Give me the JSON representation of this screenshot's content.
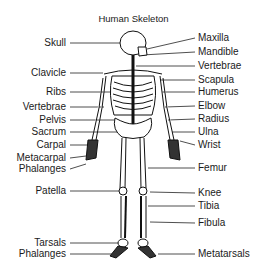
{
  "title": "Human Skeleton",
  "labels_left": [
    {
      "text": "Skull",
      "y": 42
    },
    {
      "text": "Clavicle",
      "y": 72
    },
    {
      "text": "Ribs",
      "y": 91
    },
    {
      "text": "Vertebrae",
      "y": 106
    },
    {
      "text": "Pelvis",
      "y": 119
    },
    {
      "text": "Sacrum",
      "y": 131
    },
    {
      "text": "Carpal",
      "y": 144
    },
    {
      "text": "Metacarpal",
      "y": 157
    },
    {
      "text": "Phalanges",
      "y": 168
    },
    {
      "text": "Patella",
      "y": 190
    },
    {
      "text": "Tarsals",
      "y": 242
    },
    {
      "text": "Phalanges",
      "y": 253
    }
  ],
  "labels_right": [
    {
      "text": "Maxilla",
      "y": 37
    },
    {
      "text": "Mandible",
      "y": 51
    },
    {
      "text": "Vertebrae",
      "y": 65
    },
    {
      "text": "Scapula",
      "y": 79
    },
    {
      "text": "Humerus",
      "y": 91
    },
    {
      "text": "Elbow",
      "y": 105
    },
    {
      "text": "Radius",
      "y": 118
    },
    {
      "text": "Ulna",
      "y": 131
    },
    {
      "text": "Wrist",
      "y": 144
    },
    {
      "text": "Femur",
      "y": 167
    },
    {
      "text": "Knee",
      "y": 192
    },
    {
      "text": "Tibia",
      "y": 205
    },
    {
      "text": "Fibula",
      "y": 222
    },
    {
      "text": "Metatarsals",
      "y": 253
    }
  ]
}
